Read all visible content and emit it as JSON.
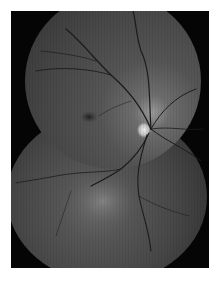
{
  "image": {
    "type": "fundus-photograph-montage",
    "description": "Grayscale retinal fundus montage of two overlapping circular fields showing optic disc, macula and retinal vessels",
    "colors": {
      "background": "#ffffff",
      "frame": "#050505",
      "retina": "#4a4a4a",
      "optic_disc": "#d8d8d8",
      "vessels": "#1e1e1e",
      "macula": "#2a2a2a"
    },
    "features": {
      "optic_disc": {
        "x": 145,
        "y": 130
      },
      "macula": {
        "x": 90,
        "y": 117
      },
      "lower_bright_region": {
        "x": 100,
        "y": 205
      }
    }
  }
}
